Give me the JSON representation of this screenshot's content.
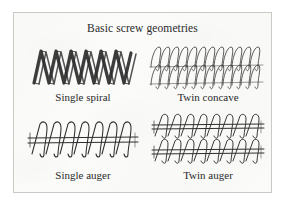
{
  "figure": {
    "title": "Basic screw geometries",
    "background_color": "#fbfbfa",
    "border_color": "#c9c9c6",
    "ink_color": "#2a2a2a"
  },
  "panels": [
    {
      "id": "single-spiral",
      "caption": "Single spiral",
      "art_name": "single-spiral-diagram",
      "description": "Thick ribbon helix drawn as a bold zigzag with rounded crests and sharp V valleys, no central shaft",
      "geometry": {
        "turns": 4.5,
        "stroke_weight": "heavy",
        "has_shaft": false,
        "flight_shape": "zigzag-ribbon",
        "ribbon_offset_px": 5
      }
    },
    {
      "id": "twin-concave",
      "caption": "Twin concave",
      "art_name": "twin-concave-diagram",
      "description": "Two interleaved fine-line helical coils, slanted loops, stacked so the coil rows overlap",
      "geometry": {
        "turns": 11,
        "stroke_weight": "light",
        "has_shaft": false,
        "flight_shape": "slanted-coil",
        "rows": 2
      }
    },
    {
      "id": "single-auger",
      "caption": "Single auger",
      "art_name": "single-auger-diagram",
      "description": "One horizontal shaft with a sinusoidal helical flight wound around it",
      "geometry": {
        "turns": 7,
        "stroke_weight": "light",
        "has_shaft": true,
        "flight_shape": "sinusoidal-flight",
        "rows": 1
      }
    },
    {
      "id": "twin-auger",
      "caption": "Twin auger",
      "art_name": "twin-auger-diagram",
      "description": "Two parallel augers stacked vertically, each a shaft with a helical flight",
      "geometry": {
        "turns": 7,
        "stroke_weight": "light",
        "has_shaft": true,
        "flight_shape": "sinusoidal-flight",
        "rows": 2
      }
    }
  ]
}
